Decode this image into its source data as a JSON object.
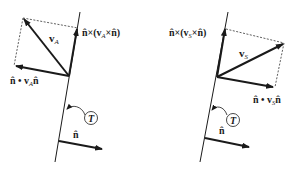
{
  "figure": {
    "colors": {
      "ink": "#1a1a1a",
      "background": "#ffffff"
    },
    "left_panel": {
      "vector_label": "v",
      "vector_subscript": "A",
      "tangential_label_prefix": "n̂×(",
      "tangential_label_v": "v",
      "tangential_label_sub": "A",
      "tangential_label_suffix": "×n̂)",
      "normal_label_prefix": "n̂ • ",
      "normal_label_v": "v",
      "normal_label_sub": "A",
      "normal_label_suffix": "n̂",
      "surface_label": "T",
      "unit_normal_label": "n̂"
    },
    "right_panel": {
      "vector_label": "v",
      "vector_subscript": "S",
      "tangential_label_prefix": "n̂×(",
      "tangential_label_v": "v",
      "tangential_label_sub": "S",
      "tangential_label_suffix": "×n̂)",
      "normal_label_prefix": "n̂ • ",
      "normal_label_v": "v",
      "normal_label_sub": "S",
      "normal_label_suffix": "n̂",
      "surface_label": "T",
      "unit_normal_label": "n̂"
    }
  }
}
